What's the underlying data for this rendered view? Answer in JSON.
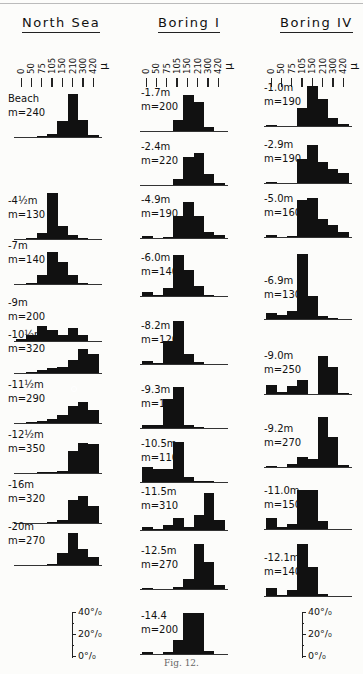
{
  "figure": {
    "caption": "Fig. 12."
  },
  "axis": {
    "tick_labels": [
      "0",
      "50",
      "75",
      "105",
      "150",
      "210",
      "300",
      "420"
    ],
    "unit": "μ",
    "scale_labels": [
      "40%",
      "20%",
      "0%"
    ]
  },
  "chart_data": {
    "type": "bar",
    "xlabel": "Grain size (μ)",
    "ylabel": "Percent",
    "bins": [
      "0-50",
      "50-75",
      "75-105",
      "105-150",
      "150-210",
      "210-300",
      "300-420",
      ">420"
    ],
    "ylim": [
      0,
      40
    ],
    "columns": [
      {
        "title": "North Sea",
        "samples": [
          {
            "depth": "Beach",
            "median": "m=240",
            "values": [
              0,
              0,
              1,
              3,
              15,
              40,
              16,
              2
            ]
          },
          {
            "depth": "-4½m",
            "median": "m=130",
            "values": [
              0,
              1,
              6,
              43,
              12,
              4,
              1,
              0
            ]
          },
          {
            "depth": "-7m",
            "median": "m=140",
            "values": [
              0,
              1,
              8,
              30,
              20,
              8,
              1,
              0
            ]
          },
          {
            "depth": "-9m",
            "median": "m=200",
            "values": [
              2,
              6,
              14,
              10,
              6,
              12,
              6,
              0
            ]
          },
          {
            "depth": "-10½m",
            "median": "m=320",
            "values": [
              0,
              1,
              3,
              5,
              6,
              12,
              22,
              18
            ]
          },
          {
            "depth": "-11½m",
            "median": "m=290",
            "values": [
              0,
              1,
              2,
              4,
              7,
              16,
              19,
              12
            ]
          },
          {
            "depth": "-12½m",
            "median": "m=350",
            "values": [
              0,
              0,
              1,
              1,
              2,
              20,
              28,
              27
            ]
          },
          {
            "depth": "-16m",
            "median": "m=320",
            "values": [
              0,
              0,
              0,
              1,
              3,
              21,
              25,
              16
            ]
          },
          {
            "depth": "-20m",
            "median": "m=270",
            "values": [
              0,
              0,
              0,
              1,
              11,
              30,
              15,
              7
            ]
          }
        ]
      },
      {
        "title": "Boring I",
        "samples": [
          {
            "depth": "-1.7m",
            "median": "m=200",
            "values": [
              0,
              0,
              0,
              10,
              33,
              27,
              4,
              0
            ]
          },
          {
            "depth": "-2.4m",
            "median": "m=220",
            "values": [
              0,
              0,
              0,
              6,
              26,
              30,
              10,
              2
            ]
          },
          {
            "depth": "-4.9m",
            "median": "m=190",
            "values": [
              2,
              0,
              1,
              20,
              33,
              20,
              6,
              3
            ]
          },
          {
            "depth": "-6.0m",
            "median": "m=140",
            "values": [
              4,
              1,
              7,
              38,
              24,
              9,
              1,
              0
            ]
          },
          {
            "depth": "-8.2m",
            "median": "m=120",
            "values": [
              3,
              1,
              21,
              40,
              9,
              2,
              0,
              0
            ]
          },
          {
            "depth": "-9.3m",
            "median": "m=110",
            "values": [
              3,
              3,
              27,
              38,
              3,
              1,
              0,
              0
            ]
          },
          {
            "depth": "-10.5m",
            "median": "m=110",
            "values": [
              14,
              12,
              12,
              37,
              5,
              1,
              1,
              0
            ]
          },
          {
            "depth": "-11.5m",
            "median": "m=310",
            "values": [
              3,
              1,
              5,
              11,
              3,
              14,
              34,
              9
            ]
          },
          {
            "depth": "-12.5m",
            "median": "m=270",
            "values": [
              1,
              0,
              0,
              2,
              9,
              42,
              25,
              4
            ]
          },
          {
            "depth": "-14.4",
            "median": "m=200",
            "values": [
              2,
              0,
              2,
              13,
              38,
              38,
              3,
              0
            ]
          }
        ]
      },
      {
        "title": "Boring IV",
        "samples": [
          {
            "depth": "-1.0m",
            "median": "m=190",
            "values": [
              1,
              0,
              0,
              17,
              37,
              25,
              7,
              2
            ]
          },
          {
            "depth": "-2.9m",
            "median": "m=190",
            "values": [
              1,
              0,
              0,
              22,
              35,
              19,
              13,
              9
            ]
          },
          {
            "depth": "-5.0m",
            "median": "m=160",
            "values": [
              2,
              0,
              1,
              34,
              36,
              17,
              11,
              5
            ]
          },
          {
            "depth": "-6.9m",
            "median": "m=130",
            "values": [
              6,
              4,
              7,
              60,
              21,
              3,
              1,
              0
            ]
          },
          {
            "depth": "-9.0m",
            "median": "m=250",
            "values": [
              8,
              2,
              7,
              13,
              0,
              35,
              25,
              1
            ]
          },
          {
            "depth": "-9.2m",
            "median": "m=270",
            "values": [
              1,
              0,
              3,
              9,
              7,
              46,
              28,
              2
            ]
          },
          {
            "depth": "-11.0m",
            "median": "m=150",
            "values": [
              10,
              2,
              5,
              36,
              36,
              7,
              0,
              0
            ]
          },
          {
            "depth": "-12.1m",
            "median": "m=140",
            "values": [
              7,
              1,
              6,
              48,
              27,
              2,
              0,
              0
            ]
          }
        ]
      }
    ]
  }
}
